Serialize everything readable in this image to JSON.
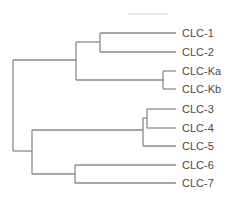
{
  "diagram": {
    "type": "dendrogram",
    "title": "",
    "line_color": "#8a8a8a",
    "label_color": "#4a4a4a",
    "leaves": [
      {
        "label": "CLC-1",
        "y": 33
      },
      {
        "label": "CLC-2",
        "y": 52
      },
      {
        "label": "CLC-Ka",
        "y": 71
      },
      {
        "label": "CLC-Kb",
        "y": 89
      },
      {
        "label": "CLC-3",
        "y": 109
      },
      {
        "label": "CLC-4",
        "y": 128
      },
      {
        "label": "CLC-5",
        "y": 146
      },
      {
        "label": "CLC-6",
        "y": 165
      },
      {
        "label": "CLC-7",
        "y": 183
      }
    ],
    "leaf_end_x": 176,
    "topology": "((((CLC-1,CLC-2),(CLC-Ka,CLC-Kb)),(((CLC-3,CLC-4),CLC-5),(CLC-6,CLC-7))))",
    "nodes": [
      {
        "id": "root",
        "x": 13,
        "y_top": 60,
        "y_bottom": 151
      },
      {
        "id": "clade-1-2-K",
        "x": 76,
        "y_top": 42,
        "y_bottom": 80,
        "attach_y": 60
      },
      {
        "id": "clade-1-2",
        "x": 100,
        "y_top": 33,
        "y_bottom": 52,
        "attach_y": 42
      },
      {
        "id": "clade-K",
        "x": 163,
        "y_top": 71,
        "y_bottom": 89,
        "attach_y": 80
      },
      {
        "id": "clade-3-7",
        "x": 32,
        "y_top": 130,
        "y_bottom": 174,
        "attach_y": 151
      },
      {
        "id": "clade-3-5",
        "x": 143,
        "y_top": 118,
        "y_bottom": 146,
        "attach_y": 130
      },
      {
        "id": "clade-3-4",
        "x": 147,
        "y_top": 109,
        "y_bottom": 128,
        "attach_y": 118
      },
      {
        "id": "clade-6-7",
        "x": 75,
        "y_top": 165,
        "y_bottom": 183,
        "attach_y": 174
      }
    ],
    "scale_bar": {
      "x1": 128,
      "x2": 168,
      "y": 14,
      "label": ""
    }
  }
}
